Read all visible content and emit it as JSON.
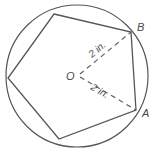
{
  "diagram": {
    "type": "inscribed-regular-pentagon",
    "colors": {
      "stroke": "#555555",
      "text": "#4a4a4a",
      "background": "#ffffff"
    },
    "circle": {
      "cx": 77,
      "cy": 76,
      "r": 71
    },
    "center": {
      "label": "O",
      "x": 78,
      "y": 75
    },
    "vertices": [
      {
        "id": "top-left",
        "x": 54,
        "y": 14
      },
      {
        "id": "B",
        "label": "B",
        "x": 131,
        "y": 32
      },
      {
        "id": "A",
        "label": "A",
        "x": 136,
        "y": 110
      },
      {
        "id": "bottom",
        "x": 59,
        "y": 139
      },
      {
        "id": "left",
        "x": 8,
        "y": 78
      }
    ],
    "radii": [
      {
        "to": "B",
        "label": "2 in."
      },
      {
        "to": "A",
        "label": "2 in."
      }
    ]
  }
}
